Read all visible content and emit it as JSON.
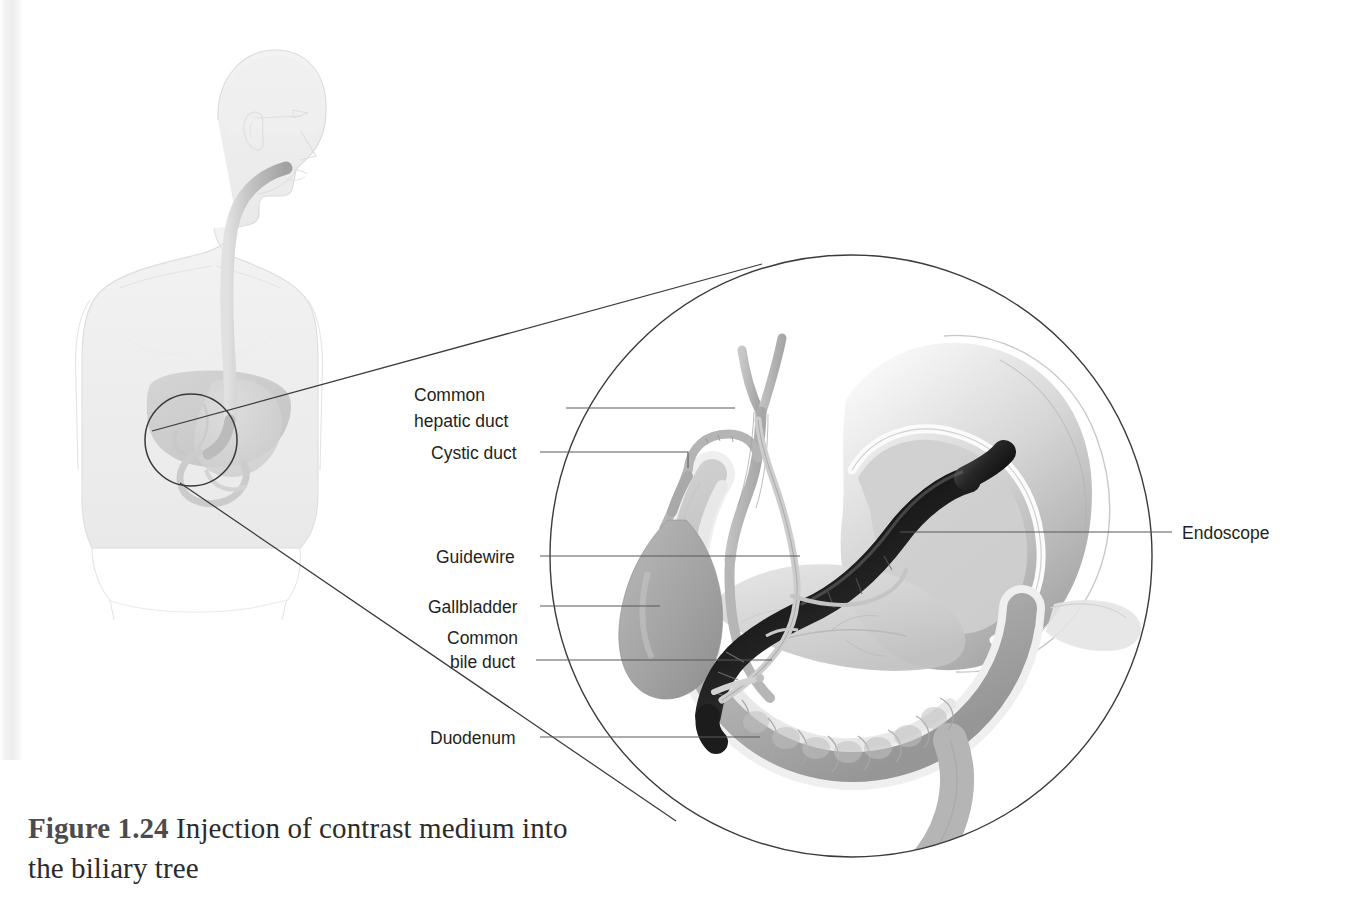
{
  "figure": {
    "number_label": "Figure 1.24",
    "caption_text": "Injection of contrast medium into the biliary tree",
    "full_caption": "Figure 1.24 Injection of contrast medium into the biliary tree"
  },
  "labels": {
    "common_hepatic_duct_line1": "Common",
    "common_hepatic_duct_line2": "hepatic duct",
    "cystic_duct": "Cystic duct",
    "guidewire": "Guidewire",
    "gallbladder": "Gallbladder",
    "common_bile_duct_line1": "Common",
    "common_bile_duct_line2": "bile duct",
    "duodenum": "Duodenum",
    "endoscope": "Endoscope"
  },
  "colors": {
    "ink": "#231f20",
    "leader": "#58595b",
    "outline": "#3b3b3b",
    "organ_mid": "#9a9a9a",
    "organ_light": "#c9c9c9",
    "organ_pale": "#e3e3e3",
    "endoscope_dark": "#161616",
    "body_outline": "#dcdcdc",
    "page_background": "#ffffff"
  },
  "anatomy": {
    "inset_view": "patient torso with endoscope passed through mouth and esophagus into stomach",
    "magnified_view": "magnified circular detail of stomach, duodenum, biliary tree and endoscope",
    "structures": [
      "Common hepatic duct",
      "Cystic duct",
      "Guidewire",
      "Gallbladder",
      "Common bile duct",
      "Duodenum",
      "Endoscope",
      "Stomach",
      "Pancreas"
    ]
  }
}
